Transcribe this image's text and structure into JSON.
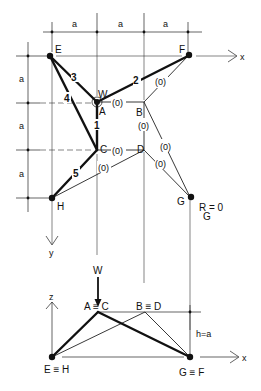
{
  "figure": {
    "plan_view": {
      "dimensions": {
        "horizontal": [
          "a",
          "a",
          "a"
        ],
        "vertical": [
          "a",
          "a",
          "a"
        ]
      },
      "axes": {
        "x": "x",
        "y": "y"
      },
      "nodes": {
        "E": "E",
        "F": "F",
        "A": "A",
        "B": "B",
        "C": "C",
        "D": "D",
        "H": "H",
        "G": "G"
      },
      "load_label": "W",
      "member_labels": {
        "m1": "1",
        "m2": "2",
        "m3": "3",
        "m4": "4",
        "m5": "5"
      },
      "zero_force_label": "(0)",
      "reaction_note": "R = 0",
      "reaction_subscript": "G"
    },
    "elevation_view": {
      "load_label": "W",
      "axes": {
        "z": "z",
        "x": "x"
      },
      "node_labels": {
        "AC": "A ≡ C",
        "BD": "B ≡ D",
        "EH": "E ≡ H",
        "GF": "G ≡ F"
      },
      "height_label": "h=a"
    },
    "colors": {
      "ink": "#111111",
      "paper": "#ffffff"
    }
  }
}
